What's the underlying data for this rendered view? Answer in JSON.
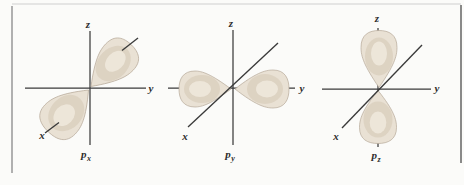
{
  "figure": {
    "colors": {
      "background": "#fbfbf9",
      "axis": "#3a3a3a",
      "label": "#2d2d2d",
      "lobe_fill": "#e9e1d4",
      "lobe_edge": "#b3a695",
      "lobe_shade": "#d7cbb9",
      "lobe_core": "#f0e9dd",
      "frame_top": "#d0d0d0",
      "frame_left": "#9e9e9e",
      "frame_right": "#5a5a5a"
    },
    "panels": [
      {
        "id": "px",
        "vertical_axis_label": "z",
        "horizontal_axis_label": "y",
        "diagonal_axis_label": "x",
        "orbital_label_base": "p",
        "orbital_label_sub": "x",
        "lobes_along": "x"
      },
      {
        "id": "py",
        "vertical_axis_label": "z",
        "horizontal_axis_label": "y",
        "diagonal_axis_label": "x",
        "orbital_label_base": "p",
        "orbital_label_sub": "y",
        "lobes_along": "y"
      },
      {
        "id": "pz",
        "vertical_axis_label": "z",
        "horizontal_axis_label": "y",
        "diagonal_axis_label": "x",
        "orbital_label_base": "p",
        "orbital_label_sub": "z",
        "lobes_along": "z"
      }
    ]
  }
}
